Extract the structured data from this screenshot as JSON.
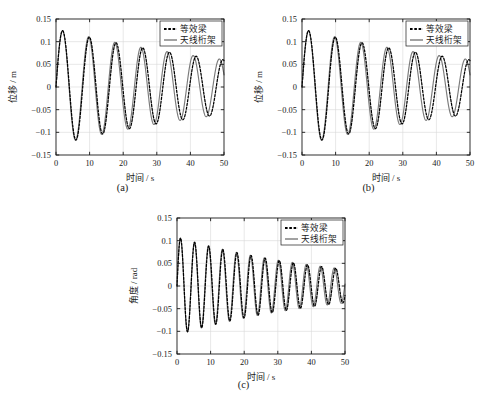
{
  "figure": {
    "panels": [
      {
        "id": "a",
        "caption": "(a)",
        "xlabel": "时间 / s",
        "ylabel": "位移 / m",
        "xticks": [
          "0",
          "10",
          "20",
          "30",
          "40",
          "50"
        ],
        "yticks": [
          "0.15",
          "0.1",
          "0.05",
          "0",
          "-0.05",
          "-0.1",
          "-0.15"
        ],
        "legend": [
          {
            "label": "等效梁",
            "style": "dashed",
            "color": "#000000"
          },
          {
            "label": "天线桁架",
            "style": "solid",
            "color": "#7a7a7a"
          }
        ]
      },
      {
        "id": "b",
        "caption": "(b)",
        "xlabel": "时间 / s",
        "ylabel": "位移 / m",
        "xticks": [
          "0",
          "10",
          "20",
          "30",
          "40",
          "50"
        ],
        "yticks": [
          "0.15",
          "0.1",
          "0.05",
          "0",
          "-0.05",
          "-0.1",
          "-0.15"
        ],
        "legend": [
          {
            "label": "等效梁",
            "style": "dashed",
            "color": "#000000"
          },
          {
            "label": "天线桁架",
            "style": "solid",
            "color": "#7a7a7a"
          }
        ]
      },
      {
        "id": "c",
        "caption": "(c)",
        "xlabel": "时间 / s",
        "ylabel": "角度 / rad",
        "xticks": [
          "0",
          "10",
          "20",
          "30",
          "40",
          "50"
        ],
        "yticks": [
          "0.15",
          "0.1",
          "0.05",
          "0",
          "-0.05",
          "-0.1",
          "-0.15"
        ],
        "legend": [
          {
            "label": "等效梁",
            "style": "dashed",
            "color": "#000000"
          },
          {
            "label": "天线桁架",
            "style": "solid",
            "color": "#7a7a7a"
          }
        ]
      }
    ]
  },
  "chart_data": [
    {
      "type": "line",
      "panel": "a",
      "title": "",
      "xlabel": "时间 / s",
      "ylabel": "位移 / m",
      "xlim": [
        0,
        50
      ],
      "ylim": [
        -0.15,
        0.15
      ],
      "xticks": [
        0,
        10,
        20,
        30,
        40,
        50
      ],
      "yticks": [
        -0.15,
        -0.1,
        -0.05,
        0,
        0.05,
        0.1,
        0.15
      ],
      "grid": true,
      "legend_position": "upper right",
      "series": [
        {
          "name": "等效梁",
          "style": "dashed",
          "color": "#000000",
          "model": "damped_sine",
          "amplitude0": 0.128,
          "damping_per_second": 0.0152,
          "period_seconds": 7.95,
          "phase_deg": -90,
          "offset": 0.0,
          "peaks": [
            0.122,
            0.105,
            0.093,
            0.082,
            0.074,
            0.068,
            0.062
          ],
          "troughs": [
            -0.118,
            -0.101,
            -0.089,
            -0.08,
            -0.072,
            -0.066,
            -0.06
          ],
          "peak_times": [
            3.7,
            11.6,
            19.6,
            27.5,
            35.4,
            43.3
          ],
          "trough_times": [
            7.7,
            15.6,
            23.5,
            31.4,
            39.3,
            47.2
          ]
        },
        {
          "name": "天线桁架",
          "style": "solid",
          "color": "#7a7a7a",
          "model": "damped_sine",
          "amplitude0": 0.128,
          "damping_per_second": 0.015,
          "period_seconds": 7.78,
          "phase_deg": -90,
          "offset": 0.0,
          "peaks": [
            0.123,
            0.106,
            0.094,
            0.083,
            0.075,
            0.069,
            0.063
          ],
          "troughs": [
            -0.119,
            -0.102,
            -0.09,
            -0.081,
            -0.073,
            -0.067,
            -0.061
          ],
          "peak_times": [
            3.6,
            11.4,
            19.2,
            27.0,
            34.8,
            42.6
          ],
          "trough_times": [
            7.5,
            15.3,
            23.1,
            30.9,
            38.7,
            46.5
          ]
        }
      ]
    },
    {
      "type": "line",
      "panel": "b",
      "title": "",
      "xlabel": "时间 / s",
      "ylabel": "位移 / m",
      "xlim": [
        0,
        50
      ],
      "ylim": [
        -0.15,
        0.15
      ],
      "xticks": [
        0,
        10,
        20,
        30,
        40,
        50
      ],
      "yticks": [
        -0.15,
        -0.1,
        -0.05,
        0,
        0.05,
        0.1,
        0.15
      ],
      "grid": true,
      "legend_position": "upper right",
      "series": [
        {
          "name": "等效梁",
          "style": "dashed",
          "color": "#000000",
          "model": "damped_sine",
          "amplitude0": 0.128,
          "damping_per_second": 0.0152,
          "period_seconds": 7.95,
          "phase_deg": -90,
          "offset": 0.0,
          "peaks": [
            0.122,
            0.105,
            0.093,
            0.082,
            0.074,
            0.068,
            0.062
          ],
          "troughs": [
            -0.118,
            -0.101,
            -0.089,
            -0.08,
            -0.072,
            -0.066,
            -0.06
          ],
          "peak_times": [
            3.7,
            11.6,
            19.6,
            27.5,
            35.4,
            43.3
          ],
          "trough_times": [
            7.7,
            15.6,
            23.5,
            31.4,
            39.3,
            47.2
          ]
        },
        {
          "name": "天线桁架",
          "style": "solid",
          "color": "#7a7a7a",
          "model": "damped_sine",
          "amplitude0": 0.128,
          "damping_per_second": 0.015,
          "period_seconds": 7.78,
          "phase_deg": -90,
          "offset": 0.0,
          "peaks": [
            0.123,
            0.106,
            0.094,
            0.083,
            0.075,
            0.069,
            0.063
          ],
          "troughs": [
            -0.119,
            -0.102,
            -0.09,
            -0.081,
            -0.073,
            -0.067,
            -0.061
          ],
          "peak_times": [
            3.6,
            11.4,
            19.2,
            27.0,
            34.8,
            42.6
          ],
          "trough_times": [
            7.5,
            15.3,
            23.1,
            30.9,
            38.7,
            46.5
          ]
        }
      ]
    },
    {
      "type": "line",
      "panel": "c",
      "title": "",
      "xlabel": "时间 / s",
      "ylabel": "角度 / rad",
      "xlim": [
        0,
        50
      ],
      "ylim": [
        -0.15,
        0.15
      ],
      "xticks": [
        0,
        10,
        20,
        30,
        40,
        50
      ],
      "yticks": [
        -0.15,
        -0.1,
        -0.05,
        0,
        0.05,
        0.1,
        0.15
      ],
      "grid": true,
      "legend_position": "upper right",
      "series": [
        {
          "name": "等效梁",
          "style": "dashed",
          "color": "#000000",
          "model": "damped_sine",
          "amplitude0": 0.108,
          "damping_per_second": 0.0215,
          "period_seconds": 4.2,
          "phase_deg": -90,
          "offset": 0.0,
          "peaks": [
            0.095,
            0.086,
            0.079,
            0.072,
            0.066,
            0.06,
            0.055,
            0.05,
            0.046,
            0.042,
            0.039,
            0.036
          ],
          "troughs": [
            -0.102,
            -0.09,
            -0.082,
            -0.075,
            -0.068,
            -0.062,
            -0.057,
            -0.052,
            -0.047,
            -0.043,
            -0.04,
            -0.037
          ],
          "start_value": 0.075
        },
        {
          "name": "天线桁架",
          "style": "solid",
          "color": "#7a7a7a",
          "model": "damped_sine",
          "amplitude0": 0.108,
          "damping_per_second": 0.0213,
          "period_seconds": 4.16,
          "phase_deg": -90,
          "offset": 0.0,
          "peaks": [
            0.096,
            0.087,
            0.08,
            0.073,
            0.067,
            0.061,
            0.056,
            0.051,
            0.047,
            0.043,
            0.04,
            0.037
          ],
          "troughs": [
            -0.103,
            -0.091,
            -0.083,
            -0.076,
            -0.069,
            -0.063,
            -0.058,
            -0.053,
            -0.048,
            -0.044,
            -0.041,
            -0.038
          ],
          "start_value": 0.075
        }
      ]
    }
  ]
}
